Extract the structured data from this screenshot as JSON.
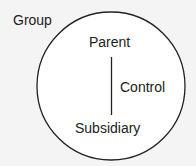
{
  "diagram": {
    "outer_label": "Group",
    "top_node": "Parent",
    "bottom_node": "Subsidiary",
    "relation": "Control",
    "stroke_color": "#222222",
    "background": "#f4f4f4"
  }
}
